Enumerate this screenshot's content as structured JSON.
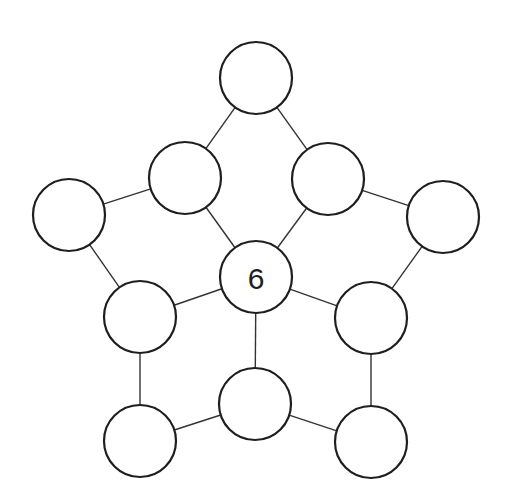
{
  "diagram": {
    "type": "number-puzzle-graph",
    "node_radius": 36,
    "nodes": [
      {
        "id": "top",
        "x": 256,
        "y": 78,
        "label": ""
      },
      {
        "id": "upper-left",
        "x": 185,
        "y": 178,
        "label": ""
      },
      {
        "id": "upper-right",
        "x": 328,
        "y": 179,
        "label": ""
      },
      {
        "id": "far-left",
        "x": 69,
        "y": 215,
        "label": ""
      },
      {
        "id": "far-right",
        "x": 443,
        "y": 217,
        "label": ""
      },
      {
        "id": "center",
        "x": 256,
        "y": 277,
        "label": "6"
      },
      {
        "id": "mid-left",
        "x": 140,
        "y": 317,
        "label": ""
      },
      {
        "id": "mid-right",
        "x": 371,
        "y": 318,
        "label": ""
      },
      {
        "id": "bottom-center",
        "x": 255,
        "y": 404,
        "label": ""
      },
      {
        "id": "bottom-left",
        "x": 140,
        "y": 441,
        "label": ""
      },
      {
        "id": "bottom-right",
        "x": 371,
        "y": 442,
        "label": ""
      }
    ],
    "edges": [
      [
        "top",
        "upper-left"
      ],
      [
        "top",
        "upper-right"
      ],
      [
        "upper-left",
        "far-left"
      ],
      [
        "upper-right",
        "far-right"
      ],
      [
        "upper-left",
        "center"
      ],
      [
        "upper-right",
        "center"
      ],
      [
        "far-left",
        "mid-left"
      ],
      [
        "far-right",
        "mid-right"
      ],
      [
        "center",
        "mid-left"
      ],
      [
        "center",
        "mid-right"
      ],
      [
        "center",
        "bottom-center"
      ],
      [
        "mid-left",
        "bottom-left"
      ],
      [
        "mid-right",
        "bottom-right"
      ],
      [
        "bottom-left",
        "bottom-center"
      ],
      [
        "bottom-center",
        "bottom-right"
      ]
    ]
  }
}
